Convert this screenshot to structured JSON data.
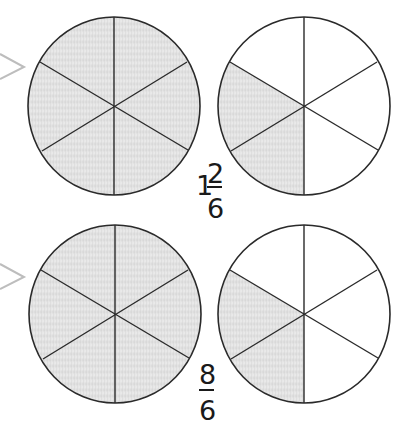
{
  "colors": {
    "outline": "#2a2a2a",
    "shade": "#dedede",
    "shade_light": "#ececec",
    "arrow": "#bdbdbd",
    "text": "#1a1a1a"
  },
  "rows": [
    {
      "label": {
        "whole": "1",
        "numerator": "2",
        "denominator": "6"
      },
      "circles": [
        {
          "parts": 6,
          "shaded": 6
        },
        {
          "parts": 6,
          "shaded": 2
        }
      ]
    },
    {
      "label": {
        "whole": "",
        "numerator": "8",
        "denominator": "6"
      },
      "circles": [
        {
          "parts": 6,
          "shaded": 6
        },
        {
          "parts": 6,
          "shaded": 2
        }
      ]
    }
  ]
}
